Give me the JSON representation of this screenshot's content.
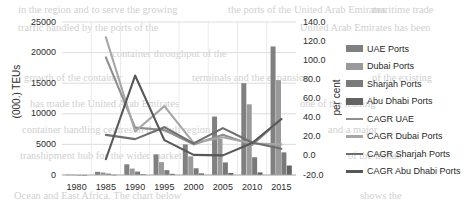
{
  "chart_data": {
    "type": "bar",
    "title": "",
    "subtitle": "",
    "xlabel": "",
    "ylabel": "(000.) TEUs",
    "y2label": "per cent",
    "categories": [
      "1980",
      "1985",
      "1990",
      "1995",
      "2000",
      "2005",
      "2010",
      "2015"
    ],
    "ylim": [
      0,
      25000
    ],
    "y2lim": [
      -20.0,
      140.0
    ],
    "y_ticks": [
      "0",
      "5000",
      "10000",
      "15000",
      "20000",
      "25000"
    ],
    "y2_ticks": [
      "-20.0",
      "0.0",
      "20.0",
      "40.0",
      "60.0",
      "80.0",
      "100.0",
      "120.0",
      "140.0"
    ],
    "grid": true,
    "legend_position": "right",
    "bar_series": [
      {
        "name": "UAE Ports",
        "axis": "left",
        "color": "#808080",
        "values": [
          60,
          520,
          1750,
          3350,
          5000,
          9550,
          15000,
          21000
        ]
      },
      {
        "name": "Dubai Ports",
        "axis": "left",
        "color": "#9a9a9a",
        "values": [
          50,
          420,
          1050,
          2100,
          3050,
          5900,
          11550,
          15500
        ]
      },
      {
        "name": "Sharjah Ports",
        "axis": "left",
        "color": "#7a7a7a",
        "values": [
          10,
          230,
          560,
          800,
          1100,
          2050,
          2900,
          3700
        ]
      },
      {
        "name": "Abu Dhabi Ports",
        "axis": "left",
        "color": "#636363",
        "values": [
          5,
          40,
          130,
          190,
          260,
          330,
          420,
          1550
        ]
      }
    ],
    "line_series": [
      {
        "name": "CAGR UAE",
        "axis": "right",
        "color": "#8e8e8e",
        "values": [
          null,
          103.0,
          29.5,
          27.0,
          12.0,
          22.0,
          11.5,
          38.5
        ]
      },
      {
        "name": "CAGR Dubai Ports",
        "axis": "right",
        "color": "#a6a6a6",
        "values": [
          null,
          124.0,
          25.5,
          52.0,
          13.5,
          19.5,
          13.0,
          12.0
        ]
      },
      {
        "name": "CAGR Sharjah Ports",
        "axis": "right",
        "color": "#6e6e6e",
        "values": [
          null,
          22.0,
          17.5,
          30.0,
          13.0,
          29.0,
          14.0,
          7.5
        ]
      },
      {
        "name": "CAGR Abu Dhabi Ports",
        "axis": "right",
        "color": "#575757",
        "values": [
          null,
          -3.5,
          84.0,
          16.5,
          1.0,
          0.5,
          13.5,
          38.5
        ]
      }
    ],
    "legend_items": [
      {
        "label": "UAE Ports",
        "kind": "bar",
        "color": "#808080"
      },
      {
        "label": "Dubai Ports",
        "kind": "bar",
        "color": "#9a9a9a"
      },
      {
        "label": "Sharjah Ports",
        "kind": "bar",
        "color": "#7a7a7a"
      },
      {
        "label": "Abu Dhabi Ports",
        "kind": "bar",
        "color": "#636363"
      },
      {
        "label": "CAGR UAE",
        "kind": "line",
        "color": "#8e8e8e"
      },
      {
        "label": "CAGR Dubai Ports",
        "kind": "line",
        "color": "#a6a6a6"
      },
      {
        "label": "CAGR Sharjah Ports",
        "kind": "line",
        "color": "#6e6e6e"
      },
      {
        "label": "CAGR Abu Dhabi Ports",
        "kind": "line",
        "color": "#575757"
      }
    ]
  },
  "background_text": [
    {
      "text": "in the region and to serve the growing",
      "x": 18,
      "y": 4
    },
    {
      "text": "the ports of the United Arab Emirates",
      "x": 228,
      "y": 4
    },
    {
      "text": "maritime trade",
      "x": 372,
      "y": 4
    },
    {
      "text": "traffic handled by the ports of the",
      "x": 18,
      "y": 22
    },
    {
      "text": "United Arab Emirates has been",
      "x": 300,
      "y": 22
    },
    {
      "text": "container throughput of the",
      "x": 112,
      "y": 48
    },
    {
      "text": "growth of the container",
      "x": 24,
      "y": 72
    },
    {
      "text": "terminals and the expansion",
      "x": 192,
      "y": 72
    },
    {
      "text": "of the existing",
      "x": 372,
      "y": 72
    },
    {
      "text": "has made the United Arab Emirates",
      "x": 30,
      "y": 98
    },
    {
      "text": "one of the leading",
      "x": 300,
      "y": 98
    },
    {
      "text": "container handling centres in the Gulf region",
      "x": 22,
      "y": 124
    },
    {
      "text": "and a major",
      "x": 328,
      "y": 124
    },
    {
      "text": "transhipment hub for the wider market",
      "x": 20,
      "y": 150
    },
    {
      "text": "of the Indian",
      "x": 348,
      "y": 150
    },
    {
      "text": "Ocean and East Africa. The chart below",
      "x": 14,
      "y": 190
    },
    {
      "text": "shows the",
      "x": 360,
      "y": 190
    }
  ]
}
